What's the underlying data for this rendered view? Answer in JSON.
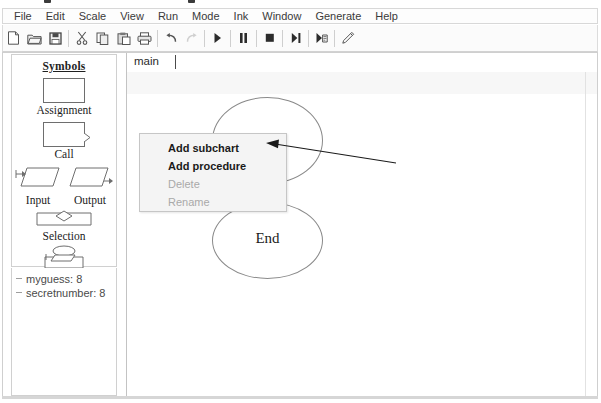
{
  "app": {
    "title_visible": false
  },
  "menubar": {
    "items": [
      {
        "label": "File"
      },
      {
        "label": "Edit"
      },
      {
        "label": "Scale"
      },
      {
        "label": "View"
      },
      {
        "label": "Run"
      },
      {
        "label": "Mode"
      },
      {
        "label": "Ink"
      },
      {
        "label": "Window"
      },
      {
        "label": "Generate"
      },
      {
        "label": "Help"
      }
    ]
  },
  "toolbar": {
    "buttons": [
      {
        "icon": "new-file-icon",
        "enabled": true
      },
      {
        "icon": "open-folder-icon",
        "enabled": true
      },
      {
        "icon": "save-floppy-icon",
        "enabled": true
      },
      {
        "icon": "cut-scissors-icon",
        "enabled": true
      },
      {
        "icon": "copy-icon",
        "enabled": true
      },
      {
        "icon": "paste-icon",
        "enabled": true
      },
      {
        "icon": "print-icon",
        "enabled": true
      },
      {
        "icon": "undo-icon",
        "enabled": true
      },
      {
        "icon": "redo-icon",
        "enabled": false
      },
      {
        "icon": "run-play-icon",
        "enabled": true
      },
      {
        "icon": "pause-icon",
        "enabled": true
      },
      {
        "icon": "stop-icon",
        "enabled": true
      },
      {
        "icon": "step-over-icon",
        "enabled": true
      },
      {
        "icon": "step-into-icon",
        "enabled": true
      },
      {
        "icon": "pencil-icon",
        "enabled": true
      }
    ],
    "zoom": {
      "slider_value": 45,
      "level": "150%",
      "caret": "▾"
    }
  },
  "sidebar": {
    "symbols_title": "Symbols",
    "symbols": [
      {
        "label": "Assignment",
        "shape": "rectangle"
      },
      {
        "label": "Call",
        "shape": "call-rectangle"
      },
      {
        "label": "Input",
        "shape": "parallelogram-in"
      },
      {
        "label": "Output",
        "shape": "parallelogram-out"
      },
      {
        "label": "Selection",
        "shape": "diamond"
      },
      {
        "label": "Loop",
        "shape": "loop"
      }
    ],
    "variables": [
      {
        "text": "myguess: 8"
      },
      {
        "text": "secretnumber: 8"
      }
    ]
  },
  "workspace": {
    "tab": {
      "label": "main"
    },
    "shapes": [
      {
        "type": "ellipse",
        "label": ""
      },
      {
        "type": "ellipse",
        "label": "End"
      }
    ]
  },
  "context_menu": {
    "items": [
      {
        "label": "Add subchart",
        "enabled": true,
        "bold": true
      },
      {
        "label": "Add procedure",
        "enabled": true,
        "bold": true
      },
      {
        "label": "Delete",
        "enabled": false,
        "bold": false
      },
      {
        "label": "Rename",
        "enabled": false,
        "bold": false
      }
    ]
  },
  "annotation": {
    "target": "Add subchart",
    "type": "arrow"
  },
  "colors": {
    "menu_background": "#fdfdfd",
    "toolbar_background": "#fbfbfb",
    "context_menu_background": "#f4f4f4",
    "canvas_background": "#ffffff",
    "disabled_text": "#a9a9a9",
    "shape_stroke": "#8a8a8a"
  }
}
